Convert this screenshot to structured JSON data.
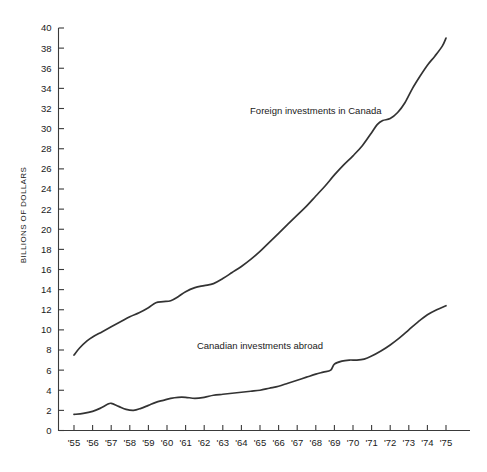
{
  "chart_data": {
    "type": "line",
    "title": "",
    "xlabel": "",
    "ylabel": "BILLIONS OF DOLLARS",
    "ylim": [
      0,
      40
    ],
    "xlim": [
      1955,
      1975
    ],
    "grid": false,
    "legend_position": "inline-annotation",
    "y_ticks": [
      0,
      2,
      4,
      6,
      8,
      10,
      12,
      14,
      16,
      18,
      20,
      22,
      24,
      26,
      28,
      30,
      32,
      34,
      36,
      38,
      40
    ],
    "y_tick_labels": [
      "0",
      "2",
      "4",
      "6",
      "8",
      "10",
      "12",
      "14",
      "16",
      "18",
      "20",
      "22",
      "24",
      "26",
      "28",
      "30",
      "32",
      "34",
      "36",
      "38",
      "40"
    ],
    "x": [
      1955,
      1956,
      1957,
      1958,
      1959,
      1960,
      1961,
      1962,
      1963,
      1964,
      1965,
      1966,
      1967,
      1968,
      1969,
      1970,
      1971,
      1972,
      1973,
      1974,
      1975
    ],
    "x_tick_labels": [
      "'55",
      "'56",
      "'57",
      "'58",
      "'59",
      "'60",
      "'61",
      "'62",
      "'63",
      "'64",
      "'65",
      "'66",
      "'67",
      "'68",
      "'69",
      "'70",
      "'71",
      "'72",
      "'73",
      "'74",
      "'75"
    ],
    "series": [
      {
        "name": "Foreign investments in Canada",
        "label_x": 1968,
        "label_y": 31.5,
        "values": [
          7.5,
          9.2,
          10.2,
          11.4,
          12.3,
          12.7,
          13.6,
          14.2,
          15.1,
          16.0,
          17.2,
          18.6,
          20.0,
          21.5,
          23.2,
          25.0,
          26.6,
          28.0,
          30.8,
          31.5,
          33.0
        ]
      },
      {
        "name": "Canadian investments abroad",
        "label_x": 1965,
        "label_y": 8.1,
        "values": [
          1.6,
          1.9,
          2.6,
          2.2,
          2.3,
          2.8,
          2.9,
          3.2,
          3.5,
          3.7,
          3.9,
          4.0,
          3.9,
          4.1,
          4.6,
          5.0,
          5.3,
          6.5,
          6.6,
          7.3,
          8.6
        ]
      }
    ],
    "series_end_values": {
      "Foreign investments in Canada": 39.0,
      "Canadian investments abroad": 12.4
    },
    "curve_points": {
      "foreign_investments_in_canada": [
        [
          1955.0,
          7.5
        ],
        [
          1955.3,
          8.2
        ],
        [
          1955.7,
          8.9
        ],
        [
          1956.0,
          9.3
        ],
        [
          1956.5,
          9.8
        ],
        [
          1957.0,
          10.3
        ],
        [
          1957.5,
          10.8
        ],
        [
          1958.0,
          11.3
        ],
        [
          1958.5,
          11.7
        ],
        [
          1959.0,
          12.2
        ],
        [
          1959.4,
          12.7
        ],
        [
          1959.8,
          12.8
        ],
        [
          1960.2,
          12.9
        ],
        [
          1960.6,
          13.3
        ],
        [
          1961.0,
          13.8
        ],
        [
          1961.5,
          14.2
        ],
        [
          1962.0,
          14.4
        ],
        [
          1962.5,
          14.6
        ],
        [
          1963.0,
          15.1
        ],
        [
          1963.5,
          15.7
        ],
        [
          1964.0,
          16.3
        ],
        [
          1964.5,
          17.0
        ],
        [
          1965.0,
          17.8
        ],
        [
          1965.5,
          18.7
        ],
        [
          1966.0,
          19.6
        ],
        [
          1966.5,
          20.5
        ],
        [
          1967.0,
          21.4
        ],
        [
          1967.5,
          22.3
        ],
        [
          1968.0,
          23.3
        ],
        [
          1968.5,
          24.3
        ],
        [
          1969.0,
          25.4
        ],
        [
          1969.5,
          26.4
        ],
        [
          1970.0,
          27.3
        ],
        [
          1970.5,
          28.3
        ],
        [
          1971.0,
          29.6
        ],
        [
          1971.3,
          30.4
        ],
        [
          1971.6,
          30.8
        ],
        [
          1972.0,
          31.0
        ],
        [
          1972.4,
          31.6
        ],
        [
          1972.8,
          32.6
        ],
        [
          1973.2,
          34.0
        ],
        [
          1973.6,
          35.2
        ],
        [
          1974.0,
          36.3
        ],
        [
          1974.4,
          37.2
        ],
        [
          1974.8,
          38.2
        ],
        [
          1975.0,
          39.0
        ]
      ],
      "canadian_investments_abroad": [
        [
          1955.0,
          1.6
        ],
        [
          1955.5,
          1.7
        ],
        [
          1956.0,
          1.9
        ],
        [
          1956.4,
          2.2
        ],
        [
          1956.8,
          2.6
        ],
        [
          1957.0,
          2.7
        ],
        [
          1957.4,
          2.4
        ],
        [
          1957.8,
          2.1
        ],
        [
          1958.2,
          2.0
        ],
        [
          1958.6,
          2.2
        ],
        [
          1959.0,
          2.5
        ],
        [
          1959.4,
          2.8
        ],
        [
          1959.8,
          3.0
        ],
        [
          1960.2,
          3.2
        ],
        [
          1960.6,
          3.3
        ],
        [
          1961.0,
          3.3
        ],
        [
          1961.5,
          3.2
        ],
        [
          1962.0,
          3.3
        ],
        [
          1962.5,
          3.5
        ],
        [
          1963.0,
          3.6
        ],
        [
          1963.5,
          3.7
        ],
        [
          1964.0,
          3.8
        ],
        [
          1964.5,
          3.9
        ],
        [
          1965.0,
          4.0
        ],
        [
          1965.5,
          4.2
        ],
        [
          1966.0,
          4.4
        ],
        [
          1966.5,
          4.7
        ],
        [
          1967.0,
          5.0
        ],
        [
          1967.5,
          5.3
        ],
        [
          1968.0,
          5.6
        ],
        [
          1968.4,
          5.8
        ],
        [
          1968.8,
          6.0
        ],
        [
          1969.0,
          6.6
        ],
        [
          1969.4,
          6.9
        ],
        [
          1969.8,
          7.0
        ],
        [
          1970.2,
          7.0
        ],
        [
          1970.6,
          7.1
        ],
        [
          1971.0,
          7.4
        ],
        [
          1971.5,
          7.9
        ],
        [
          1972.0,
          8.5
        ],
        [
          1972.5,
          9.2
        ],
        [
          1973.0,
          10.0
        ],
        [
          1973.5,
          10.8
        ],
        [
          1974.0,
          11.5
        ],
        [
          1974.5,
          12.0
        ],
        [
          1975.0,
          12.4
        ]
      ]
    }
  },
  "axis": {
    "y_title": "BILLIONS OF DOLLARS"
  },
  "annotations": {
    "upper_series_label": "Foreign investments in Canada",
    "lower_series_label": "Canadian investments abroad"
  },
  "colors": {
    "line": "#333333",
    "axis": "#3a3a3a",
    "text": "#1a1a1a",
    "background": "#ffffff"
  }
}
